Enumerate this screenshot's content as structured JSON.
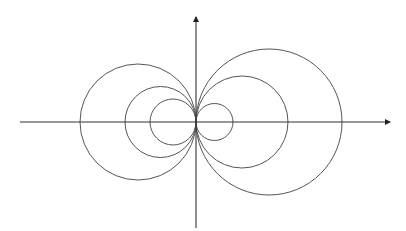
{
  "diagram": {
    "title": "",
    "stroke_color": "#555555",
    "axis_color": "#333333",
    "background": "#ffffff",
    "origin": {
      "x": 196,
      "y": 122
    },
    "x_axis": {
      "x1": 20,
      "x2": 390,
      "arrow": "right"
    },
    "y_axis": {
      "y1": 228,
      "y2": 17,
      "arrow": "up"
    },
    "circles": [
      {
        "side": "left",
        "r": 58
      },
      {
        "side": "left",
        "r": 35.5
      },
      {
        "side": "left",
        "r": 23
      },
      {
        "side": "right",
        "r": 18.5
      },
      {
        "side": "right",
        "r": 46
      },
      {
        "side": "right",
        "r": 73
      }
    ]
  }
}
